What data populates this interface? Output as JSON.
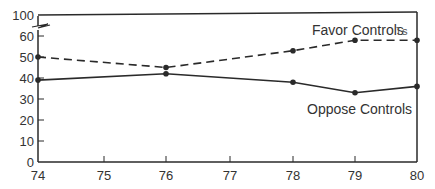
{
  "chart_data": {
    "type": "line",
    "title": "",
    "xlabel": "",
    "ylabel": "",
    "x": [
      "74",
      "75",
      "76",
      "77",
      "78",
      "79",
      "80"
    ],
    "y_ticks": [
      "0",
      "10",
      "20",
      "30",
      "40",
      "50",
      "60",
      "100"
    ],
    "ylim": [
      0,
      100
    ],
    "axis_break": "between 60 and 100",
    "grid": false,
    "legend_position": "inline labels",
    "series": [
      {
        "name": "Favor Controls",
        "style": "dashed",
        "points": [
          {
            "x": "74",
            "y": 50
          },
          {
            "x": "76",
            "y": 45
          },
          {
            "x": "78",
            "y": 53
          },
          {
            "x": "79",
            "y": 58
          },
          {
            "x": "80",
            "y": 58
          }
        ]
      },
      {
        "name": "Oppose Controls",
        "style": "solid",
        "points": [
          {
            "x": "74",
            "y": 39
          },
          {
            "x": "76",
            "y": 42
          },
          {
            "x": "78",
            "y": 38
          },
          {
            "x": "79",
            "y": 33
          },
          {
            "x": "80",
            "y": 36
          }
        ]
      }
    ],
    "annotations": [
      "ls"
    ]
  },
  "labels": {
    "favor": "Favor Controls",
    "oppose": "Oppose Controls",
    "stray_mark": "ls"
  },
  "colors": {
    "line": "#2a2a2a",
    "text": "#333333",
    "background": "#ffffff"
  }
}
